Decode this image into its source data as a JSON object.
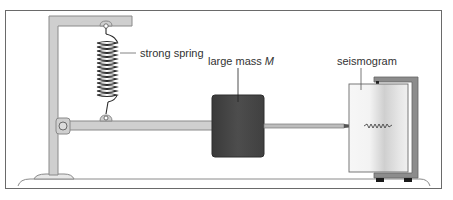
{
  "diagram": {
    "labels": {
      "spring": "strong spring",
      "mass_prefix": "large mass ",
      "mass_symbol": "M",
      "seismogram": "seismogram"
    },
    "colors": {
      "frame_fill": "#cfcfcf",
      "frame_stroke": "#8a8a8a",
      "mass_fill": "#4a4a4a",
      "bracket_fill": "#8c8c8c",
      "foot_fill": "#1a1a1a",
      "border": "#6a6a6a",
      "text": "#333333"
    },
    "components": [
      "support-frame",
      "strong-spring",
      "hinge-pivot",
      "lever-arm",
      "large-mass",
      "pen-needle",
      "seismogram-drum",
      "drum-bracket",
      "ground-base"
    ]
  }
}
